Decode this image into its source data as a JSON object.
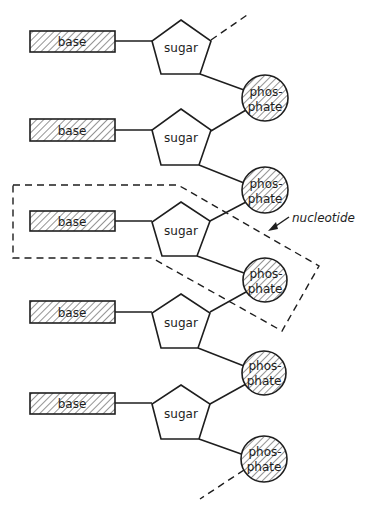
{
  "diagram": {
    "colors": {
      "ink": "#1e1e1e",
      "background": "#ffffff"
    },
    "units": [
      {
        "base_label": "base",
        "sugar_label": "sugar",
        "phosphate_label_line1": "phos-",
        "phosphate_label_line2": "phate"
      },
      {
        "base_label": "base",
        "sugar_label": "sugar",
        "phosphate_label_line1": "phos-",
        "phosphate_label_line2": "phate"
      },
      {
        "base_label": "base",
        "sugar_label": "sugar",
        "phosphate_label_line1": "phos-",
        "phosphate_label_line2": "phate"
      },
      {
        "base_label": "base",
        "sugar_label": "sugar",
        "phosphate_label_line1": "phos-",
        "phosphate_label_line2": "phate"
      },
      {
        "base_label": "base",
        "sugar_label": "sugar",
        "phosphate_label_line1": "phos-",
        "phosphate_label_line2": "phate"
      }
    ],
    "nucleotide_label": "nucleotide"
  }
}
